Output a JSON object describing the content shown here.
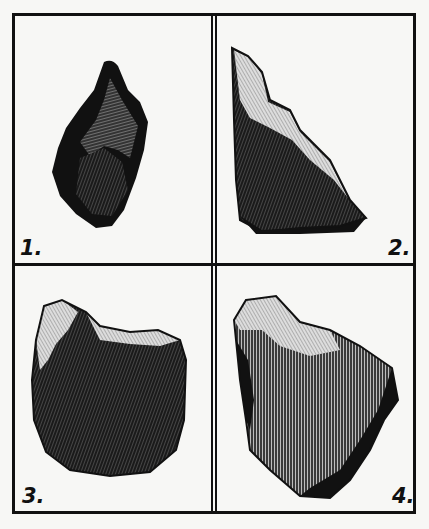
{
  "plate": {
    "figures": [
      {
        "label": "1.",
        "description": "Stone tool, pointed hand-axe, dark hatched engraving"
      },
      {
        "label": "2.",
        "description": "Stone flake, triangular wedge with light upper ridge"
      },
      {
        "label": "3.",
        "description": "Stone core, roughly square dark block"
      },
      {
        "label": "4.",
        "description": "Stone flake, irregular with vertical hatched face"
      }
    ],
    "colors": {
      "ink": "#111111",
      "paper": "#f7f7f5"
    }
  }
}
